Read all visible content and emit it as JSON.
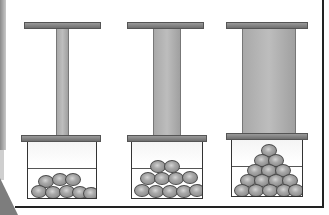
{
  "figure": {
    "colors": {
      "background": "#ffffff",
      "plate": "#7a7a7a",
      "rod": "#b0b0b0",
      "ball": "#9a9a9a",
      "outline": "#333333"
    },
    "panels": [
      {
        "id": "left",
        "rod_width": "thin",
        "ball_count": 9
      },
      {
        "id": "middle",
        "rod_width": "medium",
        "ball_count": 14
      },
      {
        "id": "right",
        "rod_width": "wide",
        "ball_count": 16
      }
    ]
  }
}
